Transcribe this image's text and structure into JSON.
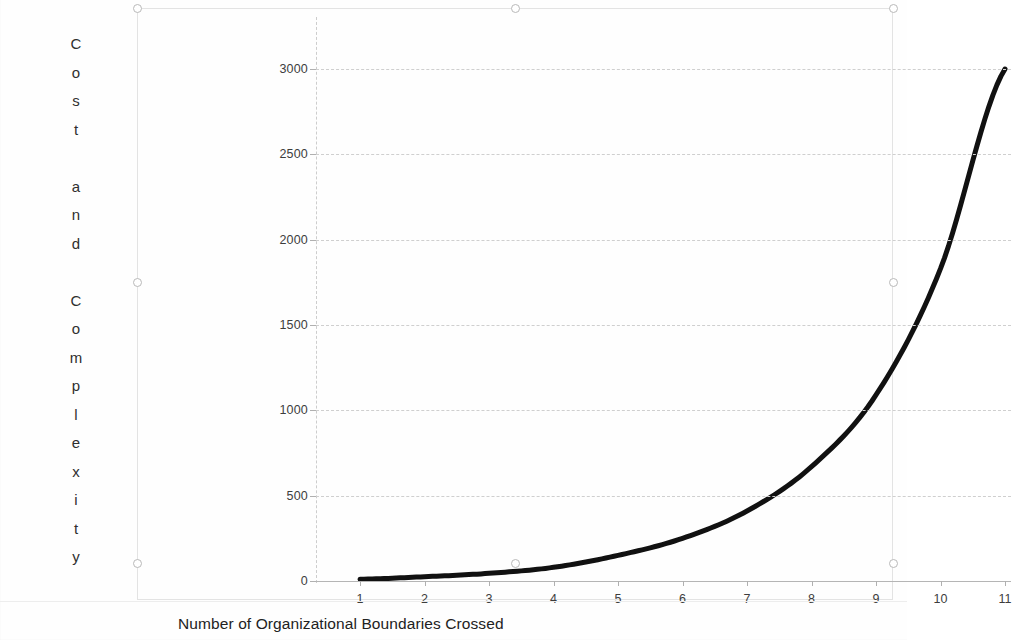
{
  "chart_data": {
    "type": "line",
    "title": "",
    "xlabel": "Number of Organizational Boundaries Crossed",
    "ylabel": "Cost and Complexity",
    "x": [
      1,
      2,
      3,
      4,
      5,
      6,
      7,
      8,
      9,
      10,
      11
    ],
    "values": [
      10,
      25,
      45,
      80,
      150,
      250,
      410,
      670,
      1090,
      1830,
      3000
    ],
    "series": [
      {
        "name": "Cost and Complexity",
        "values": [
          10,
          25,
          45,
          80,
          150,
          250,
          410,
          670,
          1090,
          1830,
          3000
        ]
      }
    ],
    "xtick_labels": [
      "1",
      "2",
      "3",
      "4",
      "5",
      "6",
      "7",
      "8",
      "9",
      "10",
      "11"
    ],
    "ytick_labels": [
      "0",
      "500",
      "1000",
      "1500",
      "2000",
      "2500",
      "3000"
    ],
    "ytick_values": [
      0,
      500,
      1000,
      1500,
      2000,
      2500,
      3000
    ],
    "xlim": [
      1,
      11
    ],
    "ylim": [
      0,
      3000
    ],
    "grid": true,
    "grid_axis": "y",
    "legend": false,
    "line_color": "#111111",
    "line_width": 5,
    "gridline_color": "#cfcfcf"
  },
  "ylabel_chars": [
    "C",
    "o",
    "s",
    "t",
    "",
    "a",
    "n",
    "d",
    "",
    "C",
    "o",
    "m",
    "p",
    "l",
    "e",
    "x",
    "i",
    "t",
    "y"
  ],
  "selection": {
    "selected": true,
    "handle_color": "#b9b9b9"
  }
}
